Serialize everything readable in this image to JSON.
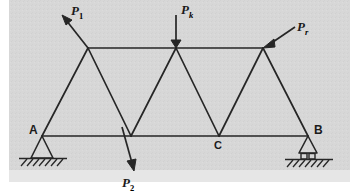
{
  "figure": {
    "kind": "engineering-statics-truss-diagram",
    "background_color": "#d7d7d7",
    "page_color": "#ffffff",
    "line_color": "#262626"
  },
  "labels": {
    "support_a": "A",
    "support_b": "B",
    "joint_c": "C",
    "load_1_base": "P",
    "load_1_sub": "1",
    "load_2_base": "P",
    "load_2_sub": "2",
    "load_k_base": "P",
    "load_k_sub": "k",
    "load_r_base": "P",
    "load_r_sub": "r"
  },
  "geometry": {
    "bottom_chord_y": 136,
    "top_chord_y": 48,
    "ground_y": 160,
    "bottom_nodes": [
      {
        "name": "A",
        "x": 42,
        "y": 136
      },
      {
        "name": "n2",
        "x": 131,
        "y": 136
      },
      {
        "name": "C",
        "x": 219,
        "y": 136
      },
      {
        "name": "B",
        "x": 308,
        "y": 136
      }
    ],
    "top_nodes": [
      {
        "name": "t1",
        "x": 88,
        "y": 48
      },
      {
        "name": "t2",
        "x": 176,
        "y": 48
      },
      {
        "name": "t3",
        "x": 263,
        "y": 48
      }
    ]
  },
  "loads": [
    {
      "id": "P1",
      "label_base": "P",
      "label_sub": "1",
      "direction": "up-left",
      "applied_at": "t1",
      "tail": {
        "x": 88,
        "y": 48
      },
      "head": {
        "x": 63,
        "y": 16
      },
      "label_pos": {
        "x": 70,
        "y": 14
      }
    },
    {
      "id": "Pk",
      "label_base": "P",
      "label_sub": "k",
      "direction": "down",
      "applied_at": "t2",
      "tail": {
        "x": 176,
        "y": 15
      },
      "head": {
        "x": 176,
        "y": 46
      },
      "label_pos": {
        "x": 180,
        "y": 14
      }
    },
    {
      "id": "Pr",
      "label_base": "P",
      "label_sub": "r",
      "direction": "down-left",
      "applied_at": "t3",
      "tail": {
        "x": 295,
        "y": 27
      },
      "head": {
        "x": 266,
        "y": 47
      },
      "label_pos": {
        "x": 297,
        "y": 30
      }
    },
    {
      "id": "P2",
      "label_base": "P",
      "label_sub": "2",
      "direction": "down-right",
      "applied_at": "n2",
      "tail": {
        "x": 122,
        "y": 128
      },
      "head": {
        "x": 133,
        "y": 168
      },
      "label_pos": {
        "x": 122,
        "y": 186
      }
    }
  ],
  "supports": [
    {
      "id": "A",
      "type": "pin",
      "x": 42,
      "label": "A"
    },
    {
      "id": "B",
      "type": "roller",
      "x": 308,
      "label": "B"
    }
  ]
}
